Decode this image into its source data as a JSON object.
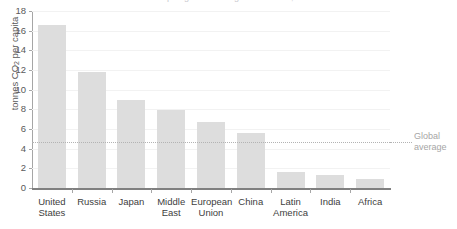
{
  "title_cropped": "Per capita greenhouse gas emissions, 2019",
  "chart_data": {
    "type": "bar",
    "title": "",
    "xlabel": "",
    "ylabel": "tonnes CO2 per capita",
    "ylabel_prefix": "tonnes CO",
    "ylabel_sub": "2",
    "ylabel_suffix": " per capita",
    "categories": [
      "United States",
      "Russia",
      "Japan",
      "Middle East",
      "European Union",
      "China",
      "Latin America",
      "India",
      "Africa"
    ],
    "category_lines": [
      [
        "United",
        "States"
      ],
      [
        "Russia",
        ""
      ],
      [
        "Japan",
        ""
      ],
      [
        "Middle",
        "East"
      ],
      [
        "European",
        "Union"
      ],
      [
        "China",
        ""
      ],
      [
        "Latin",
        "America"
      ],
      [
        "India",
        ""
      ],
      [
        "Africa",
        ""
      ]
    ],
    "values": [
      16.6,
      11.8,
      8.9,
      7.9,
      6.7,
      5.6,
      1.6,
      1.3,
      0.9
    ],
    "ylim": [
      0,
      18
    ],
    "yticks": [
      0,
      2,
      4,
      6,
      8,
      10,
      12,
      14,
      16,
      18
    ],
    "grid": true,
    "legend_position": "none",
    "annotations": [
      {
        "name": "global-average",
        "label_line1": "Global",
        "label_line2": "average",
        "value": 4.7,
        "style": "dotted-horizontal-line"
      }
    ],
    "colors": {
      "bar": "#dddddd",
      "gridline": "#f2f2f2",
      "axis": "#a6a6a6",
      "baseline": "#808080",
      "annotation": "#a6a6a6",
      "text": "#404040"
    }
  }
}
